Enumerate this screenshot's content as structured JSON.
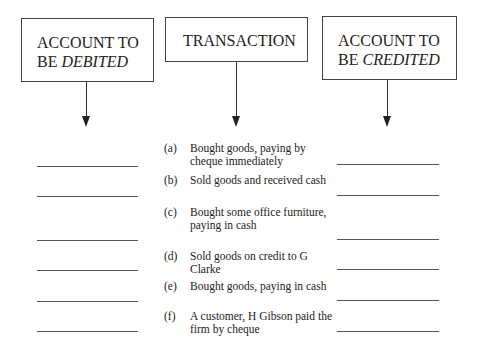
{
  "header_boxes": {
    "debit": {
      "line1": "ACCOUNT TO",
      "line2_prefix": "BE ",
      "line2_emph": "DEBITED"
    },
    "transaction": {
      "label": "TRANSACTION"
    },
    "credit": {
      "line1": "ACCOUNT TO",
      "line2_prefix": "BE ",
      "line2_emph": "CREDITED"
    }
  },
  "transactions": [
    {
      "label": "(a)",
      "text": "Bought goods, paying by cheque immediately"
    },
    {
      "label": "(b)",
      "text": "Sold goods and received cash"
    },
    {
      "label": "(c)",
      "text": "Bought some office furniture, paying in cash"
    },
    {
      "label": "(d)",
      "text": "Sold goods on credit to G Clarke"
    },
    {
      "label": "(e)",
      "text": "Bought goods, paying in cash"
    },
    {
      "label": "(f)",
      "text": "A customer, H Gibson paid the firm by cheque"
    }
  ],
  "debit_answers": [
    "",
    "",
    "",
    "",
    "",
    ""
  ],
  "credit_answers": [
    "",
    "",
    "",
    "",
    "",
    ""
  ]
}
